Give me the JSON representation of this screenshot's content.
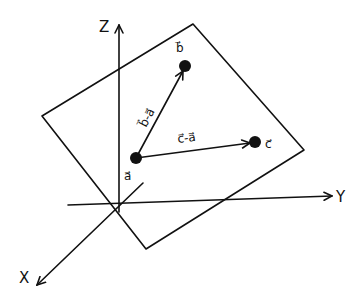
{
  "diagram": {
    "type": "3d-vector-plane-sketch",
    "axes": {
      "z": {
        "label": "Z"
      },
      "y": {
        "label": "Y"
      },
      "x": {
        "label": "X"
      }
    },
    "plane": {
      "description": "tilted quadrilateral plane containing points a, b, c"
    },
    "points": [
      {
        "id": "a",
        "label": "a⃗"
      },
      {
        "id": "b",
        "label": "b⃗"
      },
      {
        "id": "c",
        "label": "c⃗"
      }
    ],
    "vectors": [
      {
        "from": "a",
        "to": "b",
        "label": "b⃗-a⃗"
      },
      {
        "from": "a",
        "to": "c",
        "label": "c⃗-a⃗"
      }
    ],
    "colors": {
      "ink": "#111111",
      "background": "#ffffff"
    }
  }
}
